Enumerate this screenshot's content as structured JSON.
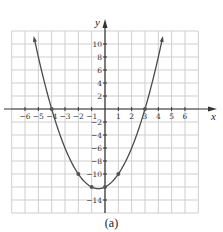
{
  "chart_data": {
    "type": "line",
    "title": "",
    "caption": "(a)",
    "xlabel": "x",
    "ylabel": "y",
    "function": "y = x^2 + x - 12",
    "xlim": [
      -7,
      7
    ],
    "ylim": [
      -16,
      12
    ],
    "grid": true,
    "x_grid_step": 1,
    "y_grid_step": 2,
    "x_ticks": [
      -6,
      -5,
      -4,
      -3,
      -2,
      -1,
      1,
      2,
      3,
      4,
      5,
      6
    ],
    "y_ticks": [
      10,
      8,
      6,
      4,
      2,
      -2,
      -4,
      -6,
      -8,
      -10,
      -14
    ],
    "curve_domain": [
      -5.3,
      4.3
    ],
    "curve_arrows": true,
    "points": [
      {
        "x": -4,
        "y": 0
      },
      {
        "x": 3,
        "y": 0
      },
      {
        "x": -2,
        "y": -10
      },
      {
        "x": 1,
        "y": -10
      },
      {
        "x": -1,
        "y": -12
      },
      {
        "x": 0,
        "y": -12
      }
    ],
    "colors": {
      "curve": "#4a4a4a",
      "grid": "#cfcfcf",
      "axis": "#333333",
      "points": "#555555"
    }
  },
  "layout": {
    "plot_left": 11.7,
    "plot_right": 198.3,
    "plot_top": 31,
    "plot_bottom": 213,
    "origin_x": 105,
    "origin_y": 109
  }
}
